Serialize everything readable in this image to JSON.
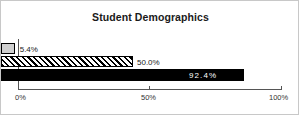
{
  "chart_data": {
    "type": "bar",
    "orientation": "horizontal",
    "title": "Student Demographics",
    "xlabel": "",
    "ylabel": "",
    "xlim": [
      0,
      100
    ],
    "grid": false,
    "legend": null,
    "categories": [
      "series-1",
      "series-2",
      "series-3"
    ],
    "values": [
      5.4,
      50.0,
      92.4
    ],
    "bars": [
      {
        "value": 5.4,
        "data_label": "5.4%",
        "fill": "light-gray",
        "fill_color": "#d0d0d0",
        "label_position": "outside",
        "label_color": "#1a1a1a"
      },
      {
        "value": 50.0,
        "data_label": "50.0%",
        "fill": "diagonal-hatch",
        "fill_color": "#ffffff",
        "label_position": "outside",
        "label_color": "#1a1a1a"
      },
      {
        "value": 92.4,
        "data_label": "92.4%",
        "fill": "solid-black",
        "fill_color": "#000000",
        "label_position": "inside",
        "label_color": "#ffffff"
      }
    ],
    "x_ticks": [
      {
        "value": 0,
        "label": "0%"
      },
      {
        "value": 50,
        "label": "50%"
      },
      {
        "value": 100,
        "label": "100%"
      }
    ],
    "colors": {
      "axis": "#555555",
      "frame": "#c8c8c8",
      "title": "#1a1a1a",
      "background": "#ffffff"
    }
  }
}
